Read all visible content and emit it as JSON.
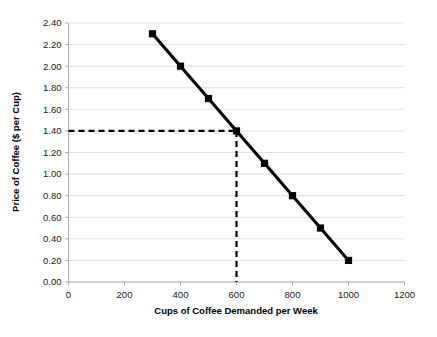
{
  "chart_data": {
    "type": "line",
    "title": "",
    "xlabel": "Cups of Coffee Demanded per Week",
    "ylabel": "Price of Coffee ($ per Cup)",
    "x": [
      300,
      400,
      500,
      600,
      700,
      800,
      900,
      1000
    ],
    "values": [
      2.3,
      2.0,
      1.7,
      1.4,
      1.1,
      0.8,
      0.5,
      0.2
    ],
    "series": [
      {
        "name": "Demand",
        "x": [
          300,
          400,
          500,
          600,
          700,
          800,
          900,
          1000
        ],
        "values": [
          2.3,
          2.0,
          1.7,
          1.4,
          1.1,
          0.8,
          0.5,
          0.2
        ]
      }
    ],
    "xlim": [
      0,
      1200
    ],
    "ylim": [
      0.0,
      2.4
    ],
    "xticks": [
      0,
      200,
      400,
      600,
      800,
      1000,
      1200
    ],
    "yticks": [
      0.0,
      0.2,
      0.4,
      0.6,
      0.8,
      1.0,
      1.2,
      1.4,
      1.6,
      1.8,
      2.0,
      2.2,
      2.4
    ],
    "xtick_labels": [
      "0",
      "200",
      "400",
      "600",
      "800",
      "1000",
      "1200"
    ],
    "ytick_labels": [
      "0.00",
      "0.20",
      "0.40",
      "0.60",
      "0.80",
      "1.00",
      "1.20",
      "1.40",
      "1.60",
      "1.80",
      "2.00",
      "2.20",
      "2.40"
    ],
    "grid": "horizontal",
    "legend": "none",
    "marker": "square",
    "annotations": [
      {
        "name": "equilibrium-guide",
        "type": "dashed-crosshair",
        "price": 1.4,
        "quantity": 600,
        "horizontal_from_x": 0,
        "vertical_to_y": 0.0
      }
    ],
    "colors": {
      "line": "#000000",
      "marker": "#000000",
      "gridline": "#d9d9d9",
      "axis": "#a6a6a6",
      "guide": "#000000",
      "text": "#1a1a1a",
      "background": "#ffffff"
    }
  },
  "axes": {
    "x_title": "Cups of Coffee Demanded per Week",
    "y_title": "Price of Coffee ($ per Cup)"
  }
}
